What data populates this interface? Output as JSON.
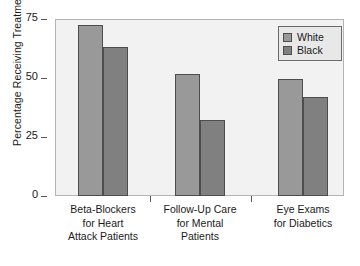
{
  "chart_data": {
    "type": "bar",
    "title": "",
    "subtitle": "",
    "xlabel": "",
    "ylabel": "Percentage Receiving Treatment",
    "ylim": [
      0,
      75
    ],
    "yticks": [
      0,
      25,
      50,
      75
    ],
    "ytick_labels": [
      "0",
      "25",
      "50",
      "75"
    ],
    "grid": false,
    "legend_position": "top-right",
    "categories": [
      "Beta-Blockers\nfor Heart\nAttack Patients",
      "Follow-Up Care\nfor Mental\nPatients",
      "Eye Exams\nfor Diabetics"
    ],
    "series": [
      {
        "name": "White",
        "color": "#999999",
        "values": [
          72.5,
          51.5,
          49.5
        ]
      },
      {
        "name": "Black",
        "color": "#808080",
        "values": [
          63.0,
          32.0,
          42.0
        ]
      }
    ]
  },
  "legend": {
    "entries": [
      {
        "label": "White",
        "color": "#999999"
      },
      {
        "label": "Black",
        "color": "#808080"
      }
    ]
  },
  "axis": {
    "y_label": "Percentage Receiving Treatment",
    "y_tick_0": "0",
    "y_tick_1": "25",
    "y_tick_2": "50",
    "y_tick_3": "75"
  },
  "groups": [
    {
      "label": "Beta-Blockers\nfor Heart\nAttack Patients"
    },
    {
      "label": "Follow-Up Care\nfor Mental\nPatients"
    },
    {
      "label": "Eye Exams\nfor Diabetics"
    }
  ],
  "colors": {
    "white_series": "#999999",
    "black_series": "#808080",
    "plot_background": "#f2f2f2",
    "frame": "#b4b4b4",
    "bar_border": "#4d4d4d",
    "text": "#1a1a1a"
  }
}
